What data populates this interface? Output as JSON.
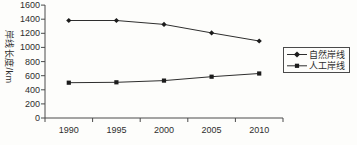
{
  "figure": {
    "background": "#fdfdfb",
    "ink_color": "#2e2e2e",
    "axis_color": "#4a4a4a"
  },
  "chart_data": {
    "type": "line",
    "title": "",
    "categories": [
      "1990",
      "1995",
      "2000",
      "2005",
      "2010"
    ],
    "series": [
      {
        "name": "自然岸线",
        "marker": "diamond",
        "values": [
          1380,
          1380,
          1325,
          1205,
          1090
        ]
      },
      {
        "name": "人工岸线",
        "marker": "square",
        "values": [
          500,
          505,
          530,
          585,
          630
        ]
      }
    ],
    "xlabel": "",
    "ylabel": "岸线长度/km",
    "ylim": [
      0,
      1600
    ],
    "yticks": [
      "1600",
      "1400",
      "1200",
      "1000",
      "800",
      "600",
      "400",
      "200",
      "0"
    ],
    "ytick_values": [
      1600,
      1400,
      1200,
      1000,
      800,
      600,
      400,
      200,
      0
    ],
    "grid": false,
    "legend_position": "middle-right",
    "legend_border": true
  }
}
